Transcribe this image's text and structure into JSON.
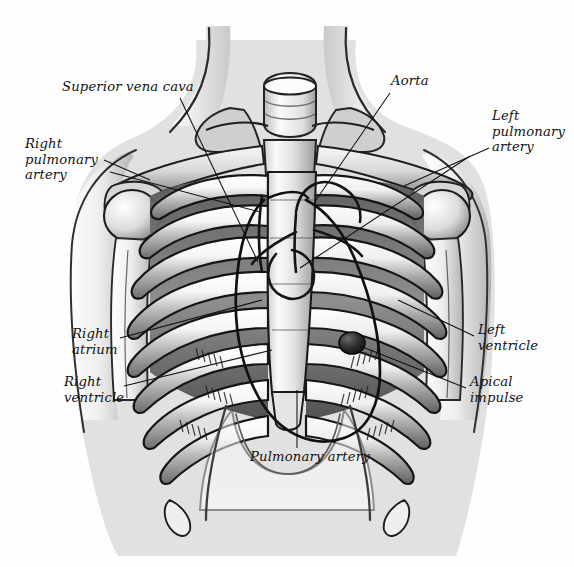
{
  "figure": {
    "background_color": "#ffffff",
    "ink_color": "#1a1a1a",
    "medium": "pencil-shaded anatomical illustration",
    "width": 574,
    "height": 567
  },
  "labels": [
    {
      "id": "superior-vena-cava",
      "text": "Superior vena cava",
      "x": 62,
      "y": 86,
      "align": "left",
      "leader": {
        "x1": 180,
        "y1": 98,
        "x2": 258,
        "y2": 262
      }
    },
    {
      "id": "aorta",
      "text": "Aorta",
      "x": 391,
      "y": 80,
      "align": "left",
      "leader": {
        "x1": 390,
        "y1": 93,
        "x2": 316,
        "y2": 200
      }
    },
    {
      "id": "right-pulmonary-artery",
      "text": "Right\npulmonary\nartery",
      "x": 25,
      "y": 140,
      "align": "left",
      "leader": {
        "x1": 104,
        "y1": 160,
        "x2": 150,
        "y2": 180
      }
    },
    {
      "id": "left-pulmonary-artery",
      "text": "Left\npulmonary\nartery",
      "x": 492,
      "y": 112,
      "align": "left",
      "leader": {
        "x1": 489,
        "y1": 148,
        "x2": 404,
        "y2": 186
      }
    },
    {
      "id": "right-atrium",
      "text": "Right\natrium",
      "x": 72,
      "y": 330,
      "align": "left",
      "leader": {
        "x1": 120,
        "y1": 338,
        "x2": 262,
        "y2": 300
      }
    },
    {
      "id": "right-ventricle",
      "text": "Right\nventricle",
      "x": 64,
      "y": 378,
      "align": "left",
      "leader": {
        "x1": 124,
        "y1": 386,
        "x2": 272,
        "y2": 350
      }
    },
    {
      "id": "left-ventricle",
      "text": "Left\nventricle",
      "x": 478,
      "y": 326,
      "align": "left",
      "leader": {
        "x1": 474,
        "y1": 336,
        "x2": 398,
        "y2": 300
      }
    },
    {
      "id": "apical-impulse",
      "text": "Apical\nimpulse",
      "x": 470,
      "y": 378,
      "align": "left",
      "leader": {
        "x1": 466,
        "y1": 388,
        "x2": 358,
        "y2": 345
      }
    },
    {
      "id": "pulmonary-artery",
      "text": "Pulmonary artery",
      "x": 250,
      "y": 453,
      "align": "left",
      "leader": {
        "x1": 297,
        "y1": 448,
        "x2": 297,
        "y2": 390
      }
    }
  ],
  "structures": [
    {
      "id": "trachea",
      "name": "trachea"
    },
    {
      "id": "clavicle-left",
      "name": "left clavicle"
    },
    {
      "id": "clavicle-right",
      "name": "right clavicle"
    },
    {
      "id": "sternum",
      "name": "sternum"
    },
    {
      "id": "xiphoid",
      "name": "xiphoid process"
    },
    {
      "id": "ribcage",
      "name": "rib cage"
    },
    {
      "id": "costal-margin",
      "name": "costal margin"
    },
    {
      "id": "scapula-left",
      "name": "left scapula"
    },
    {
      "id": "scapula-right",
      "name": "right scapula"
    },
    {
      "id": "humerus-left",
      "name": "left humerus"
    },
    {
      "id": "humerus-right",
      "name": "right humerus"
    },
    {
      "id": "heart-outline",
      "name": "heart silhouette"
    },
    {
      "id": "apical-impulse-dot",
      "name": "apical impulse marker"
    },
    {
      "id": "neck",
      "name": "neck"
    },
    {
      "id": "body-outline",
      "name": "torso outline"
    }
  ]
}
